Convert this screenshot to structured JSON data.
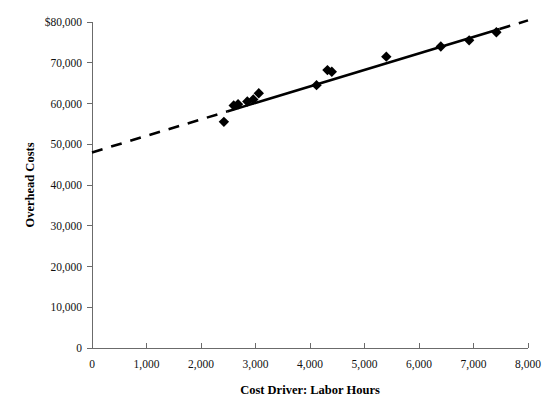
{
  "chart_data": {
    "type": "scatter",
    "title": "",
    "xlabel": "Cost Driver: Labor Hours",
    "ylabel": "Overhead Costs",
    "xlim": [
      0,
      8000
    ],
    "ylim": [
      0,
      80000
    ],
    "grid": false,
    "legend": null,
    "x_ticks": [
      0,
      1000,
      2000,
      3000,
      4000,
      5000,
      6000,
      7000,
      8000
    ],
    "x_tick_labels": [
      "0",
      "1,000",
      "2,000",
      "3,000",
      "4,000",
      "5,000",
      "6,000",
      "7,000",
      "8,000"
    ],
    "y_ticks": [
      0,
      10000,
      20000,
      30000,
      40000,
      50000,
      60000,
      70000,
      80000
    ],
    "y_tick_labels": [
      "0",
      "10,000",
      "20,000",
      "30,000",
      "40,000",
      "50,000",
      "60,000",
      "70,000",
      "$80,000"
    ],
    "marker": "diamond",
    "marker_color": "#000000",
    "points": [
      {
        "x": 2420,
        "y": 55500
      },
      {
        "x": 2600,
        "y": 59500
      },
      {
        "x": 2680,
        "y": 59800
      },
      {
        "x": 2850,
        "y": 60500
      },
      {
        "x": 2960,
        "y": 61000
      },
      {
        "x": 3060,
        "y": 62500
      },
      {
        "x": 4120,
        "y": 64500
      },
      {
        "x": 4320,
        "y": 68200
      },
      {
        "x": 4400,
        "y": 67800
      },
      {
        "x": 5400,
        "y": 71500
      },
      {
        "x": 6400,
        "y": 74000
      },
      {
        "x": 6920,
        "y": 75500
      },
      {
        "x": 7420,
        "y": 77500
      }
    ],
    "trend_line": {
      "style": "solid-with-dashed-extension",
      "color": "#000000",
      "intercept": 48000,
      "slope": 4.05,
      "solid_x_range": [
        2480,
        7480
      ],
      "dashed_left_x_range": [
        0,
        2480
      ],
      "dashed_right_x_range": [
        7480,
        8000
      ]
    }
  },
  "axes": {
    "x_title": "Cost Driver: Labor Hours",
    "y_title": "Overhead Costs"
  }
}
